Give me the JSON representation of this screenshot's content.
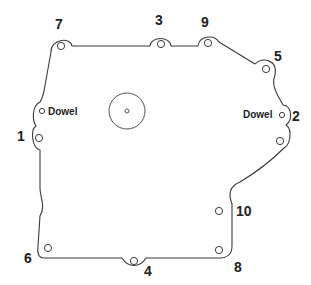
{
  "diagram": {
    "title": "",
    "labels": {
      "bolt_1": "1",
      "bolt_2": "2",
      "bolt_3": "3",
      "bolt_4": "4",
      "bolt_5": "5",
      "bolt_6": "6",
      "bolt_7": "7",
      "bolt_8": "8",
      "bolt_9": "9",
      "bolt_10": "10",
      "dowel_left": "Dowel",
      "dowel_right": "Dowel"
    },
    "tightening_sequence": [
      "1",
      "2",
      "3",
      "4",
      "5",
      "6",
      "7",
      "8",
      "9",
      "10"
    ],
    "colors": {
      "line": "#3a3a3a",
      "text": "#222222",
      "background": "#ffffff"
    }
  }
}
